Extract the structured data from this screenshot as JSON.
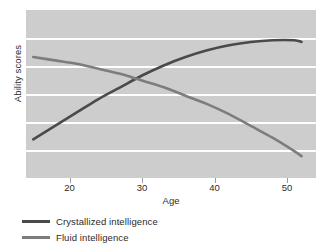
{
  "chart_data": {
    "type": "line",
    "title": "",
    "xlabel": "Age",
    "ylabel": "Ability scores",
    "xlim": [
      14,
      54
    ],
    "ylim": [
      0,
      100
    ],
    "xticks": [
      20,
      30,
      40,
      50
    ],
    "xticklabels": [
      "20",
      "30",
      "40",
      "50"
    ],
    "yticks": [],
    "yticklabels": [],
    "grid": "horizontal",
    "gridline_count": 5,
    "legend_position": "below-left",
    "plot_background": "#cdcdcd",
    "gridline_color": "#ffffff",
    "series": [
      {
        "name": "Crystallized intelligence",
        "color": "#4a4a4a",
        "x": [
          15,
          18,
          21,
          24,
          27,
          30,
          33,
          36,
          39,
          42,
          45,
          48,
          51,
          52
        ],
        "y": [
          23,
          31,
          39,
          47,
          54,
          61,
          67,
          72,
          76,
          79,
          81,
          82,
          82,
          81
        ]
      },
      {
        "name": "Fluid intelligence",
        "color": "#7d7d7d",
        "x": [
          15,
          18,
          21,
          24,
          27,
          30,
          33,
          36,
          39,
          42,
          45,
          48,
          51,
          52
        ],
        "y": [
          72,
          70,
          68,
          65,
          62,
          58,
          54,
          49,
          44,
          38,
          31,
          24,
          16,
          13
        ]
      }
    ],
    "annotations": [
      {
        "text": "crossover",
        "x": 26,
        "y": 63
      }
    ]
  },
  "legend": {
    "items": [
      {
        "label": "Crystallized intelligence",
        "color": "#4a4a4a"
      },
      {
        "label": "Fluid intelligence",
        "color": "#7d7d7d"
      }
    ]
  }
}
